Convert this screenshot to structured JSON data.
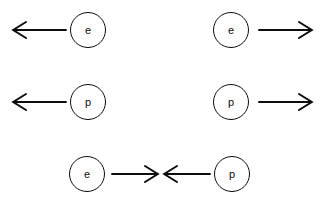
{
  "diagram": {
    "background_color": "#ffffff",
    "ink_color": "#0d0d0d",
    "width": 324,
    "height": 207,
    "rows": [
      {
        "row_index": 1,
        "items": [
          {
            "id": "row1-left",
            "arrow": {
              "direction": "left",
              "x1": 13,
              "x2": 66,
              "y": 30
            },
            "particle": {
              "label": "e",
              "name": "electron",
              "cx": 88,
              "cy": 30,
              "r": 18
            },
            "order": "arrow-then-particle"
          },
          {
            "id": "row1-right",
            "particle": {
              "label": "e",
              "name": "electron",
              "cx": 231,
              "cy": 30,
              "r": 18
            },
            "arrow": {
              "direction": "right",
              "x1": 258,
              "x2": 311,
              "y": 30
            },
            "order": "particle-then-arrow"
          }
        ]
      },
      {
        "row_index": 2,
        "items": [
          {
            "id": "row2-left",
            "arrow": {
              "direction": "left",
              "x1": 13,
              "x2": 66,
              "y": 102
            },
            "particle": {
              "label": "p",
              "name": "proton",
              "cx": 88,
              "cy": 102,
              "r": 18
            },
            "order": "arrow-then-particle"
          },
          {
            "id": "row2-right",
            "particle": {
              "label": "p",
              "name": "proton",
              "cx": 231,
              "cy": 102,
              "r": 18
            },
            "arrow": {
              "direction": "right",
              "x1": 258,
              "x2": 311,
              "y": 102
            },
            "order": "particle-then-arrow"
          }
        ]
      },
      {
        "row_index": 3,
        "items": [
          {
            "id": "row3-left",
            "particle": {
              "label": "e",
              "name": "electron",
              "cx": 87,
              "cy": 174,
              "r": 18
            },
            "arrow": {
              "direction": "right",
              "x1": 112,
              "x2": 157,
              "y": 174
            },
            "order": "particle-then-arrow"
          },
          {
            "id": "row3-right",
            "arrow": {
              "direction": "left",
              "x1": 164,
              "x2": 209,
              "y": 174
            },
            "particle": {
              "label": "p",
              "name": "proton",
              "cx": 232,
              "cy": 174,
              "r": 18
            },
            "order": "arrow-then-particle"
          }
        ]
      }
    ],
    "labels": {
      "electron": "e",
      "proton": "p"
    }
  }
}
